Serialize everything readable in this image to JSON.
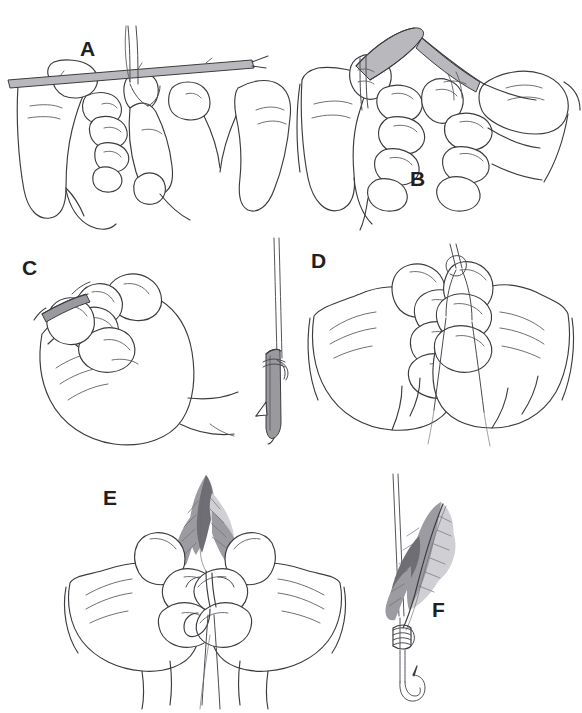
{
  "figure": {
    "background_color": "#ffffff",
    "ink_color": "#3c3c40",
    "shading_color": "#9a9a9e",
    "width": 582,
    "height": 713,
    "style": "black-and-white line drawing"
  },
  "panels": [
    {
      "id": "A",
      "label": "A",
      "label_x": 80,
      "label_y": 38,
      "caption": "Two hands hold the hook shank horizontally while the thread is laid across it"
    },
    {
      "id": "B",
      "label": "B",
      "label_x": 410,
      "label_y": 168,
      "caption": "The thread is pinched between thumb and finger of both hands forming a loop"
    },
    {
      "id": "C",
      "label": "C",
      "label_x": 22,
      "label_y": 257,
      "caption": "The hook is held in the closed fist while the thread wraps are started"
    },
    {
      "id": "D",
      "label": "D",
      "label_x": 311,
      "label_y": 250,
      "caption": "Both hands pull the thread loop tight around the hook shank"
    },
    {
      "id": "E",
      "label": "E",
      "label_x": 103,
      "label_y": 487,
      "caption": "The feather is positioned against the hook shank and held while tying"
    },
    {
      "id": "F",
      "label": "F",
      "label_x": 432,
      "label_y": 599,
      "caption": "Finished fly: feather lashed to the hook with thread wraps"
    }
  ],
  "detail_inset": {
    "id": "hook-detail",
    "caption": "Close-up of the hook shank with the thread half-hitched at the eye",
    "unlabeled": true
  },
  "objects": {
    "hook": "fish hook with shank, bend and barbed point",
    "feather": "single tapered feather with barbs",
    "thread": "tying thread / tippet line",
    "hands": "pairs of human hands shown in line art"
  }
}
